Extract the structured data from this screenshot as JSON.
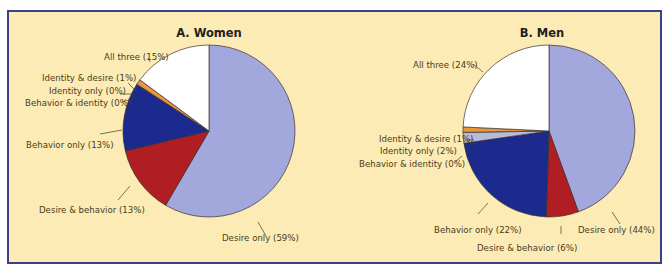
{
  "colors": {
    "frame_border": "#3b3f8c",
    "background": "#fcebb4",
    "desire_only": "#a3a8dc",
    "desire_behavior": "#b01e23",
    "behavior_only": "#1b2a8c",
    "behavior_identity": "#c9c9dd",
    "identity_only": "#b9bad8",
    "identity_desire": "#e8973a",
    "all_three": "#ffffff"
  },
  "chart_data": [
    {
      "type": "pie",
      "title": "A. Women",
      "categories": [
        "Desire only",
        "Desire & behavior",
        "Behavior only",
        "Behavior & identity",
        "Identity only",
        "Identity & desire",
        "All three"
      ],
      "values": [
        59,
        13,
        13,
        0,
        0,
        1,
        15
      ],
      "labels": [
        "Desire only (59%)",
        "Desire & behavior (13%)",
        "Behavior only (13%)",
        "Behavior & identity (0%)",
        "Identity only (0%)",
        "Identity & desire (1%)",
        "All three (15%)"
      ],
      "start_angle": "12 o'clock",
      "direction": "clockwise"
    },
    {
      "type": "pie",
      "title": "B. Men",
      "categories": [
        "Desire only",
        "Desire & behavior",
        "Behavior only",
        "Behavior & identity",
        "Identity only",
        "Identity & desire",
        "All three"
      ],
      "values": [
        44,
        6,
        22,
        0,
        2,
        1,
        24
      ],
      "labels": [
        "Desire only (44%)",
        "Desire & behavior (6%)",
        "Behavior only (22%)",
        "Behavior & identity (0%)",
        "Identity only (2%)",
        "Identity & desire (1%)",
        "All three (24%)"
      ],
      "start_angle": "12 o'clock",
      "direction": "clockwise"
    }
  ]
}
